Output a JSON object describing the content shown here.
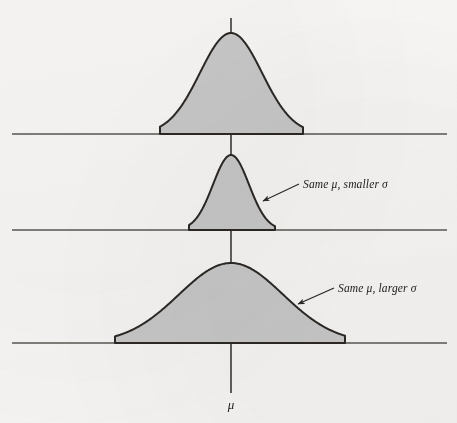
{
  "figure": {
    "background_color": "#f7f6f4",
    "curve_fill_color": "#c8c8c8",
    "curve_stroke_color": "#2b2825",
    "axis_color": "#5a5652",
    "text_color": "#23201e",
    "width": 457,
    "height": 423
  },
  "labels": {
    "mu_axis": "μ",
    "annotation_smaller": "Same μ, smaller σ",
    "annotation_larger": "Same μ, larger σ"
  },
  "chart_data": {
    "type": "line",
    "title": "",
    "subtitle": "",
    "xlabel": "μ",
    "ylabel": "",
    "grid": false,
    "legend": "none",
    "shared_mean_x_px": 231,
    "axis_line": {
      "x_px": 231,
      "y_top_px": 18,
      "y_bottom_px": 393
    },
    "baselines_y_px": [
      134,
      230,
      343
    ],
    "baseline_x_extent_px": [
      12,
      447
    ],
    "series": [
      {
        "name": "Reference normal curve",
        "panel": 1,
        "baseline_y_px": 134,
        "peak_y_px": 33,
        "peak_height_px": 101,
        "sigma_px": 31,
        "left_foot_x_px": 160,
        "right_foot_x_px": 303,
        "annotation": ""
      },
      {
        "name": "Same μ, smaller σ",
        "panel": 2,
        "baseline_y_px": 230,
        "peak_y_px": 155,
        "peak_height_px": 75,
        "sigma_px": 18,
        "left_foot_x_px": 189,
        "right_foot_x_px": 275,
        "annotation": "Same μ, smaller σ"
      },
      {
        "name": "Same μ, larger σ",
        "panel": 3,
        "baseline_y_px": 343,
        "peak_y_px": 263,
        "peak_height_px": 80,
        "sigma_px": 52,
        "left_foot_x_px": 115,
        "right_foot_x_px": 345,
        "annotation": "Same μ, larger σ"
      }
    ],
    "annotations": [
      {
        "text": "Same μ, smaller σ",
        "text_x_px": 303,
        "text_y_px": 188,
        "arrow_from_x_px": 299,
        "arrow_from_y_px": 184,
        "arrow_to_x_px": 262,
        "arrow_to_y_px": 202
      },
      {
        "text": "Same μ, larger σ",
        "text_x_px": 338,
        "text_y_px": 292,
        "arrow_from_x_px": 334,
        "arrow_from_y_px": 288,
        "arrow_to_x_px": 297,
        "arrow_to_y_px": 305
      }
    ]
  }
}
